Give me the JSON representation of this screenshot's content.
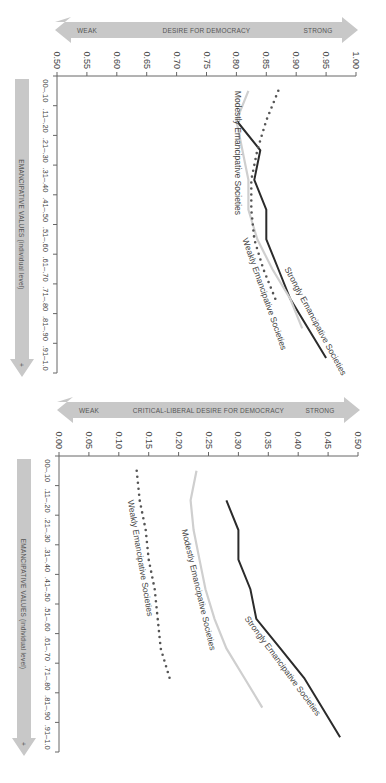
{
  "chart_data": [
    {
      "type": "line",
      "panel": "left",
      "title": "",
      "xlabel": "EMANCIPATIVE VALUES (individual level)",
      "ylabel": "DESIRE FOR DEMOCRACY",
      "y_arrow": {
        "low": "WEAK",
        "high": "STRONG"
      },
      "x_arrow_symbol": "+",
      "categories": [
        "00–.10",
        ".11–.20",
        ".21–.30",
        ".31–.40",
        ".41–.50",
        ".51–.60",
        ".61–.70",
        ".71–.80",
        ".81–.90",
        ".91–1.0"
      ],
      "yticks": [
        "0.50",
        "0.55",
        "0.60",
        "0.65",
        "0.70",
        "0.75",
        "0.80",
        "0.85",
        "0.90",
        "0.95",
        "1.00"
      ],
      "ylim": [
        0.5,
        1.0
      ],
      "grid": false,
      "legend": "inline labels",
      "series": [
        {
          "name": "Strongly Emancipative Societies",
          "style": "solid-dark",
          "values": [
            null,
            0.8,
            0.84,
            0.83,
            0.85,
            0.85,
            0.87,
            0.89,
            0.92,
            0.95
          ]
        },
        {
          "name": "Modestly Emancipative Societies",
          "style": "solid-light",
          "values": [
            0.82,
            0.8,
            0.81,
            0.82,
            0.82,
            0.835,
            0.86,
            0.89,
            0.91,
            null
          ]
        },
        {
          "name": "Weakly Emancipative Societies",
          "style": "dotted",
          "values": [
            0.87,
            0.85,
            0.835,
            0.825,
            0.825,
            0.83,
            0.845,
            0.865,
            null,
            null
          ]
        }
      ]
    },
    {
      "type": "line",
      "panel": "right",
      "title": "",
      "xlabel": "EMANCIPATIVE VALUES (individual level)",
      "ylabel": "CRITICAL-LIBERAL DESIRE FOR DEMOCRACY",
      "y_arrow": {
        "low": "WEAK",
        "high": "STRONG"
      },
      "x_arrow_symbol": "+",
      "categories": [
        "00–.10",
        ".11–.20",
        ".21–.30",
        ".31–.40",
        ".41–.50",
        ".51–.60",
        ".61–.70",
        ".71–.80",
        ".81–.90",
        ".91–1.0"
      ],
      "yticks": [
        "0.00",
        "0.05",
        "0.10",
        "0.15",
        "0.20",
        "0.25",
        "0.30",
        "0.35",
        "0.40",
        "0.45",
        "0.50"
      ],
      "ylim": [
        0.0,
        0.5
      ],
      "grid": false,
      "legend": "inline labels",
      "series": [
        {
          "name": "Strongly Emancipative Societies",
          "style": "solid-dark",
          "values": [
            null,
            0.28,
            0.3,
            0.3,
            0.32,
            0.33,
            0.37,
            0.41,
            0.44,
            0.47
          ]
        },
        {
          "name": "Modestly Emancipative Societies",
          "style": "solid-light",
          "values": [
            0.23,
            0.22,
            0.225,
            0.235,
            0.245,
            0.26,
            0.28,
            0.31,
            0.34,
            null
          ]
        },
        {
          "name": "Weakly Emancipative Societies",
          "style": "dotted",
          "values": [
            0.13,
            0.135,
            0.145,
            0.15,
            0.16,
            0.165,
            0.17,
            0.185,
            null,
            null
          ]
        }
      ]
    }
  ],
  "colors": {
    "strong_line": "#2b2b2b",
    "modest_line": "#cfcfcf",
    "weak_dots": "#555555",
    "axis": "#666666",
    "arrow_fill": "#c8c8c8"
  }
}
